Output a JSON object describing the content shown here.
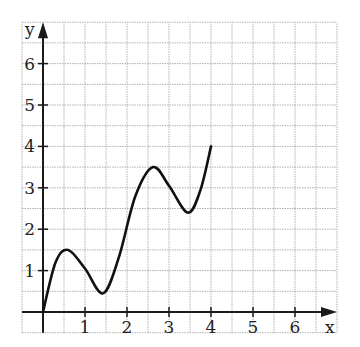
{
  "chart_data": {
    "type": "line",
    "title": "",
    "xlabel": "x",
    "ylabel": "y",
    "xlim": [
      -0.5,
      7
    ],
    "ylim": [
      -0.5,
      7
    ],
    "x_ticks": [
      "1",
      "2",
      "3",
      "4",
      "5",
      "6"
    ],
    "y_ticks": [
      "1",
      "2",
      "3",
      "4",
      "5",
      "6"
    ],
    "grid": true,
    "grid_step": 0.5,
    "series": [
      {
        "name": "f(x)",
        "x": [
          0,
          0.3,
          0.6,
          1.0,
          1.43,
          1.8,
          2.2,
          2.62,
          3.0,
          3.45,
          3.75,
          4.0
        ],
        "y": [
          0,
          1.2,
          1.5,
          1.05,
          0.45,
          1.3,
          2.8,
          3.5,
          3.05,
          2.4,
          2.95,
          4.0
        ],
        "key_points": {
          "start": [
            0,
            0
          ],
          "local_max_1": [
            0.6,
            1.5
          ],
          "local_min_1": [
            1.43,
            0.45
          ],
          "local_max_2": [
            2.62,
            3.5
          ],
          "local_min_2": [
            3.45,
            2.4
          ],
          "end": [
            4,
            4
          ]
        }
      }
    ],
    "legend": null
  },
  "colors": {
    "axis": "#1a1a1a",
    "grid": "#b0b0b0",
    "curve": "#111111",
    "background": "#ffffff"
  }
}
